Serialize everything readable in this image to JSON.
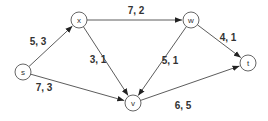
{
  "diagram": {
    "type": "flow-network",
    "nodes": [
      {
        "id": "s",
        "label": "s"
      },
      {
        "id": "x",
        "label": "x"
      },
      {
        "id": "w",
        "label": "w"
      },
      {
        "id": "v",
        "label": "v"
      },
      {
        "id": "t",
        "label": "t"
      }
    ],
    "edges": [
      {
        "from": "s",
        "to": "x",
        "label": "5, 3",
        "capacity": 5,
        "flow": 3
      },
      {
        "from": "x",
        "to": "w",
        "label": "7, 2",
        "capacity": 7,
        "flow": 2
      },
      {
        "from": "x",
        "to": "v",
        "label": "3, 1",
        "capacity": 3,
        "flow": 1
      },
      {
        "from": "s",
        "to": "v",
        "label": "7, 3",
        "capacity": 7,
        "flow": 3
      },
      {
        "from": "w",
        "to": "v",
        "label": "5, 1",
        "capacity": 5,
        "flow": 1
      },
      {
        "from": "w",
        "to": "t",
        "label": "4, 1",
        "capacity": 4,
        "flow": 1
      },
      {
        "from": "v",
        "to": "t",
        "label": "6, 5",
        "capacity": 6,
        "flow": 5
      }
    ],
    "colors": {
      "line": "#4a4a4a",
      "text": "#333333",
      "background": "#ffffff"
    }
  }
}
